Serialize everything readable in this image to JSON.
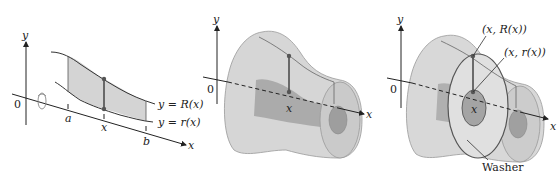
{
  "panels": [
    {
      "id": "region",
      "axis_labels": {
        "y": "y",
        "x": "x",
        "origin": "0"
      },
      "ticks": {
        "a": "a",
        "x": "x",
        "b": "b"
      },
      "curves": {
        "upper": "y = R(x)",
        "lower": "y = r(x)"
      },
      "rotation_icon": "rotate-about-x-axis"
    },
    {
      "id": "solid",
      "axis_labels": {
        "y": "y",
        "x": "x",
        "origin": "0"
      },
      "ticks": {
        "x": "x"
      }
    },
    {
      "id": "washer",
      "axis_labels": {
        "y": "y",
        "x": "x",
        "origin": "0"
      },
      "ticks": {
        "x": "x"
      },
      "annotations": {
        "outer_point": "(x, R(x))",
        "inner_point": "(x, r(x))",
        "washer": "Washer"
      }
    }
  ],
  "colors": {
    "shade": "#d4d4d4",
    "solid": "#cfcfcf",
    "inner": "#a8a8a8",
    "line": "#333333"
  }
}
